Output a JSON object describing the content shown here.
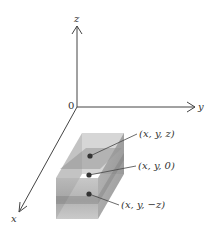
{
  "diagram": {
    "axes": {
      "origin_label": "0",
      "x_label": "x",
      "y_label": "y",
      "z_label": "z"
    },
    "points": [
      {
        "label": "(x, y, z)"
      },
      {
        "label": "(x, y, 0)"
      },
      {
        "label": "(x, y, −z)"
      }
    ],
    "colors": {
      "axis": "#444444",
      "box_light": "#c8c8c8",
      "box_dark": "#8e8e8e",
      "point": "#333333"
    }
  }
}
